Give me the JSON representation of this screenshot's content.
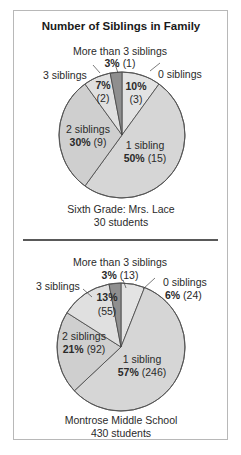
{
  "chart_data": [
    {
      "type": "pie",
      "title": "Number of Siblings in Family",
      "subtitle": "Sixth Grade: Mrs. Lace",
      "total_label": "30 students",
      "total": 30,
      "slices": [
        {
          "label": "0 siblings",
          "percent": 10,
          "count": 3,
          "color": "#e3e3e3"
        },
        {
          "label": "1 sibling",
          "percent": 50,
          "count": 15,
          "color": "#d6d6d6"
        },
        {
          "label": "2 siblings",
          "percent": 30,
          "count": 9,
          "color": "#cfcfcf"
        },
        {
          "label": "3 siblings",
          "percent": 7,
          "count": 2,
          "color": "#e0e0e0"
        },
        {
          "label": "More than 3 siblings",
          "percent": 3,
          "count": 1,
          "color": "#8f8f8f"
        }
      ]
    },
    {
      "type": "pie",
      "title": "Number of Siblings in Family",
      "subtitle": "Montrose Middle School",
      "total_label": "430 students",
      "total": 430,
      "slices": [
        {
          "label": "0 siblings",
          "percent": 6,
          "count": 24,
          "color": "#e3e3e3"
        },
        {
          "label": "1 sibling",
          "percent": 57,
          "count": 246,
          "color": "#d6d6d6"
        },
        {
          "label": "2 siblings",
          "percent": 21,
          "count": 92,
          "color": "#cfcfcf"
        },
        {
          "label": "3 siblings",
          "percent": 13,
          "count": 55,
          "color": "#e0e0e0"
        },
        {
          "label": "More than 3 siblings",
          "percent": 3,
          "count": 13,
          "color": "#8f8f8f"
        }
      ]
    }
  ],
  "figure": {
    "title": "Number of Siblings in Family",
    "chart1": {
      "caption_line1": "Sixth Grade: Mrs. Lace",
      "caption_line2": "30 students",
      "labels": {
        "more_than_3": "More than 3 siblings",
        "more_than_3_pct": "3%",
        "more_than_3_count": "(1)",
        "three": "3 siblings",
        "three_pct": "7%",
        "three_count": "(2)",
        "zero": "0 siblings",
        "zero_pct": "10%",
        "zero_count": "(3)",
        "two": "2 siblings",
        "two_pct": "30%",
        "two_count": "(9)",
        "one": "1 sibling",
        "one_pct": "50%",
        "one_count": "(15)"
      }
    },
    "chart2": {
      "caption_line1": "Montrose Middle School",
      "caption_line2": "430 students",
      "labels": {
        "more_than_3": "More than 3 siblings",
        "more_than_3_pct": "3%",
        "more_than_3_count": "(13)",
        "three": "3 siblings",
        "three_pct": "13%",
        "three_count": "(55)",
        "zero": "0 siblings",
        "zero_pct": "6%",
        "zero_count": "(24)",
        "two": "2 siblings",
        "two_pct": "21%",
        "two_count": "(92)",
        "one": "1 sibling",
        "one_pct": "57%",
        "one_count": "(246)"
      }
    }
  }
}
